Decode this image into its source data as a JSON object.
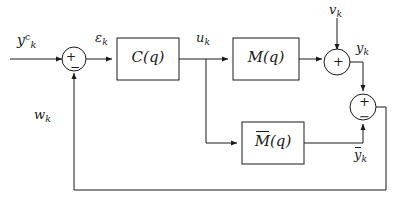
{
  "diagram": {
    "stroke_color": "#1a1a1a",
    "background": "#ffffff",
    "blocks": [
      {
        "id": "controller",
        "label_main": "C",
        "label_arg": "(q)",
        "accent": "none"
      },
      {
        "id": "plant",
        "label_main": "M",
        "label_arg": "(q)",
        "accent": "none"
      },
      {
        "id": "model",
        "label_main": "M",
        "label_arg": "(q)",
        "accent": "bar"
      }
    ],
    "signals": {
      "reference": {
        "base": "y",
        "sup": "c",
        "sub": "k"
      },
      "error": {
        "base": "ε",
        "sub": "k"
      },
      "control": {
        "base": "u",
        "sub": "k"
      },
      "disturbance": {
        "base": "v",
        "sub": "k"
      },
      "output": {
        "base": "y",
        "sub": "k"
      },
      "model_output": {
        "base": "y",
        "sub": "k",
        "accent": "bar"
      },
      "feedback": {
        "base": "w",
        "sub": "k"
      }
    },
    "summing_junctions": [
      {
        "id": "error-junction",
        "signs": [
          "+",
          "−"
        ]
      },
      {
        "id": "output-junction",
        "signs": [
          "+"
        ]
      },
      {
        "id": "residual-junction",
        "signs": [
          "+",
          "−"
        ]
      }
    ]
  }
}
